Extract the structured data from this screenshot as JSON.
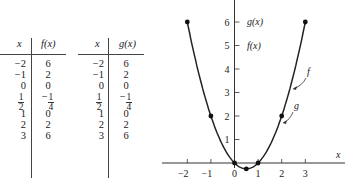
{
  "tables": [
    {
      "headers": [
        "x",
        "f(x)"
      ],
      "rows": [
        {
          "x": "−2",
          "y": "6"
        },
        {
          "x": "−1",
          "y": "2"
        },
        {
          "x": "0",
          "y": "0"
        },
        {
          "x_num": "1",
          "x_den": "2",
          "y_neg": "−",
          "y_num": "1",
          "y_den": "4"
        },
        {
          "x": "1",
          "y": "0"
        },
        {
          "x": "2",
          "y": "2"
        },
        {
          "x": "3",
          "y": "6"
        }
      ]
    },
    {
      "headers": [
        "x",
        "g(x)"
      ],
      "rows": [
        {
          "x": "−2",
          "y": "6"
        },
        {
          "x": "−1",
          "y": "2"
        },
        {
          "x": "0",
          "y": "0"
        },
        {
          "x_num": "1",
          "x_den": "2",
          "y_neg": "−",
          "y_num": "1",
          "y_den": "4"
        },
        {
          "x": "1",
          "y": "0"
        },
        {
          "x": "2",
          "y": "2"
        },
        {
          "x": "3",
          "y": "6"
        }
      ]
    }
  ],
  "chart_data": {
    "type": "line",
    "title": "",
    "xlabel": "x",
    "ylabel": "",
    "xlim": [
      -2.5,
      4.5
    ],
    "ylim": [
      -0.5,
      7
    ],
    "x_ticks": [
      "−2",
      "−1",
      "0",
      "1",
      "2",
      "3"
    ],
    "y_ticks": [
      "1",
      "2",
      "3",
      "4",
      "5",
      "6"
    ],
    "y_axis_annotations": [
      "g(x)",
      "f(x)"
    ],
    "series": [
      {
        "name": "f",
        "x": [
          -2,
          -1,
          0,
          0.5,
          1,
          2,
          3
        ],
        "values": [
          6,
          2,
          0,
          -0.25,
          0,
          2,
          6
        ]
      },
      {
        "name": "g",
        "x": [
          -2,
          -1,
          0,
          0.5,
          1,
          2,
          3
        ],
        "values": [
          6,
          2,
          0,
          -0.25,
          0,
          2,
          6
        ]
      }
    ],
    "curve_labels": [
      "f",
      "g"
    ],
    "grid": false,
    "legend": "none"
  }
}
